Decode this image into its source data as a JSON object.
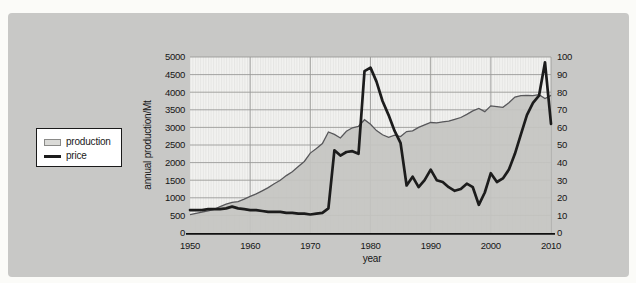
{
  "legend": {
    "production_label": "production",
    "price_label": "price"
  },
  "chart_data": {
    "type": "area+line combo",
    "title": "",
    "xlabel": "year",
    "ylabel_left": "annual production/Mt",
    "ylabel_right": "price per barrel in US$(2009)",
    "x_range": [
      1950,
      2010
    ],
    "x_ticks": [
      1950,
      1960,
      1970,
      1980,
      1990,
      2000,
      2010
    ],
    "y_left": {
      "min": 0,
      "max": 5000,
      "step": 500
    },
    "y_right": {
      "min": 0,
      "max": 100,
      "step": 10
    },
    "grid": "on",
    "legend_position": "left-middle",
    "years": [
      1950,
      1951,
      1952,
      1953,
      1954,
      1955,
      1956,
      1957,
      1958,
      1959,
      1960,
      1961,
      1962,
      1963,
      1964,
      1965,
      1966,
      1967,
      1968,
      1969,
      1970,
      1971,
      1972,
      1973,
      1974,
      1975,
      1976,
      1977,
      1978,
      1979,
      1980,
      1981,
      1982,
      1983,
      1984,
      1985,
      1986,
      1987,
      1988,
      1989,
      1990,
      1991,
      1992,
      1993,
      1994,
      1995,
      1996,
      1997,
      1998,
      1999,
      2000,
      2001,
      2002,
      2003,
      2004,
      2005,
      2006,
      2007,
      2008,
      2009,
      2010
    ],
    "series": [
      {
        "name": "production",
        "axis": "left",
        "style": "area",
        "fill_color": "#c4c4c1",
        "line_color": "#57575a",
        "values": [
          520,
          560,
          590,
          630,
          670,
          750,
          820,
          870,
          890,
          960,
          1040,
          1110,
          1200,
          1290,
          1400,
          1500,
          1630,
          1740,
          1890,
          2030,
          2270,
          2400,
          2540,
          2870,
          2800,
          2700,
          2890,
          2990,
          3030,
          3220,
          3090,
          2910,
          2790,
          2720,
          2780,
          2740,
          2880,
          2900,
          3000,
          3070,
          3140,
          3130,
          3160,
          3180,
          3230,
          3280,
          3370,
          3470,
          3540,
          3450,
          3610,
          3590,
          3570,
          3700,
          3860,
          3900,
          3910,
          3900,
          3930,
          3820,
          3910
        ]
      },
      {
        "name": "price",
        "axis": "right",
        "style": "line",
        "line_color": "#1c1c1c",
        "values": [
          13,
          13,
          13,
          13.5,
          13.5,
          13.5,
          14,
          15,
          14,
          13.5,
          13,
          13,
          12.5,
          12,
          12,
          12,
          11.5,
          11.5,
          11,
          11,
          10.5,
          11,
          11.5,
          14,
          47,
          44,
          46,
          46.5,
          45,
          92,
          94,
          86,
          75,
          67,
          58,
          51,
          27,
          32,
          26,
          30,
          36,
          30,
          29,
          26,
          24,
          25,
          28,
          26,
          16,
          23,
          34,
          29,
          31,
          36,
          45,
          56,
          67,
          74,
          78,
          97,
          62
        ]
      }
    ],
    "colors": {
      "panel_background": "#c8c8c6",
      "plot_background": "#f2f2f0",
      "gridline": "#9b9b98",
      "axis_line": "#101010"
    }
  }
}
